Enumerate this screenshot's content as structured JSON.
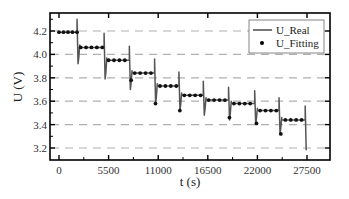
{
  "chart_data": {
    "type": "line",
    "title": "",
    "xlabel": "t (s)",
    "ylabel": "U (V)",
    "xlim": [
      -1000,
      29500
    ],
    "ylim": [
      3.1,
      4.35
    ],
    "x_ticks": [
      0,
      5500,
      11000,
      16500,
      22000,
      27500
    ],
    "x_tick_labels": [
      "0",
      "5500",
      "11000",
      "16500",
      "22000",
      "27500"
    ],
    "y_ticks": [
      3.2,
      3.4,
      3.6,
      3.8,
      4.0,
      4.2
    ],
    "y_tick_labels": [
      "3.2",
      "3.4",
      "3.6",
      "3.8",
      "4.0",
      "4.2"
    ],
    "grid": {
      "horizontal": true,
      "vertical": false,
      "style": "dashed",
      "color": "#b0b0b0"
    },
    "legend": {
      "position": "upper right",
      "entries": [
        "U_Real",
        "U_Fitting"
      ]
    },
    "series": [
      {
        "name": "U_Real",
        "style": "line",
        "color": "#555555",
        "steps": [
          {
            "t_start": 0,
            "t_end": 2000,
            "level": 4.19,
            "spike_top": 4.3,
            "dip_bottom": 3.92
          },
          {
            "t_start": 2300,
            "t_end": 5000,
            "level": 4.06,
            "spike_top": 4.18,
            "dip_bottom": 3.79
          },
          {
            "t_start": 5300,
            "t_end": 7800,
            "level": 3.95,
            "spike_top": 4.07,
            "dip_bottom": 3.7
          },
          {
            "t_start": 8100,
            "t_end": 10600,
            "level": 3.84,
            "spike_top": 3.96,
            "dip_bottom": 3.58
          },
          {
            "t_start": 10900,
            "t_end": 13300,
            "level": 3.73,
            "spike_top": 3.85,
            "dip_bottom": 3.52
          },
          {
            "t_start": 13600,
            "t_end": 16000,
            "level": 3.65,
            "spike_top": 3.77,
            "dip_bottom": 3.48
          },
          {
            "t_start": 16300,
            "t_end": 18800,
            "level": 3.61,
            "spike_top": 3.72,
            "dip_bottom": 3.44
          },
          {
            "t_start": 19100,
            "t_end": 21700,
            "level": 3.58,
            "spike_top": 3.69,
            "dip_bottom": 3.4
          },
          {
            "t_start": 22000,
            "t_end": 24400,
            "level": 3.52,
            "spike_top": 3.63,
            "dip_bottom": 3.32
          },
          {
            "t_start": 24700,
            "t_end": 27300,
            "level": 3.44,
            "spike_top": 3.56,
            "dip_bottom": 3.18
          }
        ]
      },
      {
        "name": "U_Fitting",
        "style": "markers",
        "marker": "circle",
        "color": "#111111",
        "points": [
          [
            0,
            4.19
          ],
          [
            500,
            4.19
          ],
          [
            1000,
            4.19
          ],
          [
            1500,
            4.19
          ],
          [
            2000,
            4.19
          ],
          [
            2400,
            4.06
          ],
          [
            3000,
            4.06
          ],
          [
            3600,
            4.06
          ],
          [
            4200,
            4.06
          ],
          [
            4800,
            4.06
          ],
          [
            5500,
            3.95
          ],
          [
            6100,
            3.95
          ],
          [
            6700,
            3.95
          ],
          [
            7300,
            3.95
          ],
          [
            8000,
            3.78
          ],
          [
            8400,
            3.84
          ],
          [
            9000,
            3.84
          ],
          [
            9600,
            3.84
          ],
          [
            10200,
            3.84
          ],
          [
            10700,
            3.58
          ],
          [
            11200,
            3.73
          ],
          [
            11800,
            3.73
          ],
          [
            12400,
            3.73
          ],
          [
            13000,
            3.73
          ],
          [
            13400,
            3.52
          ],
          [
            13900,
            3.65
          ],
          [
            14500,
            3.65
          ],
          [
            15100,
            3.65
          ],
          [
            15700,
            3.65
          ],
          [
            16600,
            3.61
          ],
          [
            17200,
            3.61
          ],
          [
            17800,
            3.61
          ],
          [
            18400,
            3.61
          ],
          [
            18900,
            3.46
          ],
          [
            19400,
            3.58
          ],
          [
            20000,
            3.58
          ],
          [
            20600,
            3.58
          ],
          [
            21200,
            3.58
          ],
          [
            21900,
            3.41
          ],
          [
            22300,
            3.52
          ],
          [
            22900,
            3.52
          ],
          [
            23500,
            3.52
          ],
          [
            24100,
            3.52
          ],
          [
            24600,
            3.32
          ],
          [
            25100,
            3.44
          ],
          [
            25700,
            3.44
          ],
          [
            26300,
            3.44
          ],
          [
            26900,
            3.44
          ]
        ]
      }
    ]
  }
}
